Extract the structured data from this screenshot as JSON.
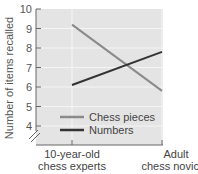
{
  "chart_data": {
    "type": "line",
    "title": "",
    "xlabel": "",
    "ylabel": "Number of items recalled",
    "categories": [
      "10-year-old chess experts",
      "Adult chess novices"
    ],
    "category_lines": [
      [
        "10-year-old",
        "chess experts"
      ],
      [
        "Adult",
        "chess novices"
      ]
    ],
    "series": [
      {
        "name": "Chess pieces",
        "values": [
          9.2,
          5.8
        ],
        "color": "#8a8a8a"
      },
      {
        "name": "Numbers",
        "values": [
          6.1,
          7.8
        ],
        "color": "#333333"
      }
    ],
    "ylim": [
      4,
      10
    ],
    "yticks": [
      4,
      5,
      6,
      7,
      8,
      9,
      10
    ],
    "axis_break": true,
    "grid": true,
    "legend_position": "lower-center",
    "background": "#e6e6e6"
  }
}
